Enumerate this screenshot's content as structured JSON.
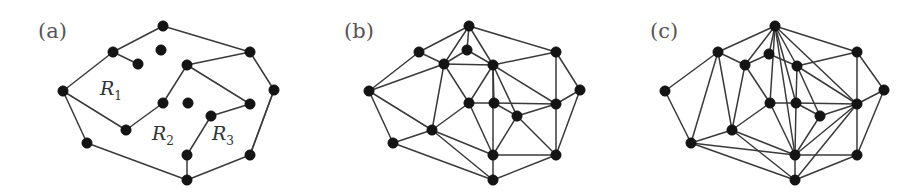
{
  "figure": {
    "background_color": "#ffffff",
    "vertex_color": "#141414",
    "edge_color": "#3a3a3a",
    "label_color": "#555555",
    "width": 919,
    "height": 195
  },
  "panels": [
    {
      "id": "a",
      "label": "(a)",
      "label_x": 38,
      "label_y": 38,
      "region_labels": [
        {
          "name": "R",
          "subscript": "1",
          "x": 100,
          "y": 95
        },
        {
          "name": "R",
          "subscript": "2",
          "x": 152,
          "y": 140
        },
        {
          "name": "R",
          "subscript": "3",
          "x": 212,
          "y": 140
        }
      ],
      "vertices": [
        {
          "id": 0,
          "x": 163,
          "y": 26
        },
        {
          "id": 1,
          "x": 113,
          "y": 52
        },
        {
          "id": 2,
          "x": 161,
          "y": 50
        },
        {
          "id": 3,
          "x": 138,
          "y": 64
        },
        {
          "id": 4,
          "x": 250,
          "y": 52
        },
        {
          "id": 5,
          "x": 187,
          "y": 65
        },
        {
          "id": 6,
          "x": 274,
          "y": 90
        },
        {
          "id": 7,
          "x": 63,
          "y": 91
        },
        {
          "id": 8,
          "x": 163,
          "y": 103
        },
        {
          "id": 9,
          "x": 188,
          "y": 103
        },
        {
          "id": 10,
          "x": 250,
          "y": 104
        },
        {
          "id": 11,
          "x": 211,
          "y": 116
        },
        {
          "id": 12,
          "x": 126,
          "y": 130
        },
        {
          "id": 13,
          "x": 87,
          "y": 143
        },
        {
          "id": 14,
          "x": 187,
          "y": 155
        },
        {
          "id": 15,
          "x": 250,
          "y": 155
        },
        {
          "id": 16,
          "x": 187,
          "y": 180
        }
      ],
      "edges": [
        [
          0,
          1
        ],
        [
          0,
          4
        ],
        [
          1,
          3
        ],
        [
          1,
          7
        ],
        [
          4,
          5
        ],
        [
          4,
          6
        ],
        [
          5,
          8
        ],
        [
          5,
          10
        ],
        [
          7,
          12
        ],
        [
          7,
          13
        ],
        [
          6,
          15
        ],
        [
          8,
          12
        ],
        [
          10,
          11
        ],
        [
          11,
          14
        ],
        [
          13,
          16
        ],
        [
          14,
          16
        ],
        [
          15,
          16
        ],
        [
          15,
          6
        ]
      ],
      "isolated_vertices": [
        2,
        9
      ]
    },
    {
      "id": "b",
      "label": "(b)",
      "label_x": 38,
      "label_y": 38,
      "region_labels": [],
      "vertices": [
        {
          "id": 0,
          "x": 163,
          "y": 26
        },
        {
          "id": 1,
          "x": 113,
          "y": 52
        },
        {
          "id": 2,
          "x": 161,
          "y": 50
        },
        {
          "id": 3,
          "x": 138,
          "y": 64
        },
        {
          "id": 4,
          "x": 250,
          "y": 52
        },
        {
          "id": 5,
          "x": 187,
          "y": 65
        },
        {
          "id": 6,
          "x": 274,
          "y": 90
        },
        {
          "id": 7,
          "x": 63,
          "y": 91
        },
        {
          "id": 8,
          "x": 163,
          "y": 103
        },
        {
          "id": 9,
          "x": 188,
          "y": 103
        },
        {
          "id": 10,
          "x": 250,
          "y": 104
        },
        {
          "id": 11,
          "x": 211,
          "y": 116
        },
        {
          "id": 12,
          "x": 126,
          "y": 130
        },
        {
          "id": 13,
          "x": 87,
          "y": 143
        },
        {
          "id": 14,
          "x": 187,
          "y": 155
        },
        {
          "id": 15,
          "x": 250,
          "y": 155
        },
        {
          "id": 16,
          "x": 187,
          "y": 180
        }
      ],
      "edges": [
        [
          0,
          1
        ],
        [
          0,
          2
        ],
        [
          0,
          3
        ],
        [
          0,
          4
        ],
        [
          0,
          5
        ],
        [
          1,
          3
        ],
        [
          1,
          7
        ],
        [
          2,
          3
        ],
        [
          2,
          5
        ],
        [
          3,
          5
        ],
        [
          3,
          7
        ],
        [
          3,
          8
        ],
        [
          3,
          12
        ],
        [
          4,
          5
        ],
        [
          4,
          6
        ],
        [
          4,
          10
        ],
        [
          5,
          8
        ],
        [
          5,
          9
        ],
        [
          5,
          10
        ],
        [
          5,
          11
        ],
        [
          5,
          14
        ],
        [
          6,
          10
        ],
        [
          6,
          15
        ],
        [
          7,
          12
        ],
        [
          7,
          13
        ],
        [
          8,
          9
        ],
        [
          8,
          12
        ],
        [
          8,
          14
        ],
        [
          9,
          10
        ],
        [
          9,
          11
        ],
        [
          10,
          11
        ],
        [
          10,
          15
        ],
        [
          11,
          14
        ],
        [
          11,
          15
        ],
        [
          12,
          13
        ],
        [
          12,
          14
        ],
        [
          12,
          16
        ],
        [
          13,
          16
        ],
        [
          14,
          15
        ],
        [
          14,
          16
        ],
        [
          15,
          16
        ]
      ],
      "isolated_vertices": []
    },
    {
      "id": "c",
      "label": "(c)",
      "label_x": 38,
      "label_y": 38,
      "region_labels": [],
      "vertices": [
        {
          "id": 0,
          "x": 163,
          "y": 26
        },
        {
          "id": 1,
          "x": 106,
          "y": 52
        },
        {
          "id": 2,
          "x": 157,
          "y": 54
        },
        {
          "id": 3,
          "x": 133,
          "y": 65
        },
        {
          "id": 4,
          "x": 245,
          "y": 52
        },
        {
          "id": 5,
          "x": 185,
          "y": 66
        },
        {
          "id": 6,
          "x": 272,
          "y": 90
        },
        {
          "id": 7,
          "x": 53,
          "y": 91
        },
        {
          "id": 8,
          "x": 158,
          "y": 103
        },
        {
          "id": 9,
          "x": 184,
          "y": 103
        },
        {
          "id": 10,
          "x": 245,
          "y": 104
        },
        {
          "id": 11,
          "x": 208,
          "y": 116
        },
        {
          "id": 12,
          "x": 120,
          "y": 130
        },
        {
          "id": 13,
          "x": 79,
          "y": 143
        },
        {
          "id": 14,
          "x": 183,
          "y": 155
        },
        {
          "id": 15,
          "x": 245,
          "y": 155
        },
        {
          "id": 16,
          "x": 183,
          "y": 180
        }
      ],
      "edges": [
        [
          0,
          1
        ],
        [
          0,
          2
        ],
        [
          0,
          3
        ],
        [
          0,
          4
        ],
        [
          0,
          5
        ],
        [
          0,
          8
        ],
        [
          0,
          9
        ],
        [
          0,
          14
        ],
        [
          0,
          10
        ],
        [
          1,
          3
        ],
        [
          1,
          7
        ],
        [
          1,
          12
        ],
        [
          1,
          13
        ],
        [
          2,
          3
        ],
        [
          2,
          5
        ],
        [
          3,
          8
        ],
        [
          3,
          12
        ],
        [
          4,
          5
        ],
        [
          4,
          6
        ],
        [
          4,
          10
        ],
        [
          5,
          9
        ],
        [
          5,
          10
        ],
        [
          5,
          11
        ],
        [
          6,
          10
        ],
        [
          6,
          15
        ],
        [
          7,
          13
        ],
        [
          8,
          9
        ],
        [
          8,
          12
        ],
        [
          8,
          14
        ],
        [
          9,
          10
        ],
        [
          9,
          11
        ],
        [
          9,
          14
        ],
        [
          10,
          11
        ],
        [
          10,
          14
        ],
        [
          10,
          15
        ],
        [
          10,
          16
        ],
        [
          11,
          14
        ],
        [
          12,
          13
        ],
        [
          12,
          14
        ],
        [
          12,
          16
        ],
        [
          13,
          14
        ],
        [
          13,
          16
        ],
        [
          14,
          15
        ],
        [
          14,
          16
        ],
        [
          15,
          16
        ]
      ],
      "isolated_vertices": []
    }
  ]
}
